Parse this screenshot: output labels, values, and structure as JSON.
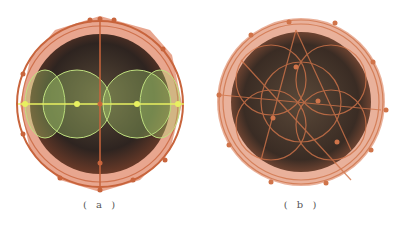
{
  "figure": {
    "panels": [
      {
        "id": "a",
        "caption": "( a )",
        "description": "Sphere with circumscribed orange wireframe polyhedron, green circles along equator with yellow axis line",
        "colors": {
          "frame": "#c8643c",
          "fill": "#d98060",
          "green": "#a8d070",
          "yellow": "#e8f060",
          "core": "#3a2a20"
        }
      },
      {
        "id": "b",
        "caption": "( b )",
        "description": "Sphere with dense orange wireframe mesh of overlapping circles and nodes",
        "colors": {
          "frame": "#d0744a",
          "fill": "#e09070",
          "core": "#3e3228"
        }
      }
    ]
  }
}
